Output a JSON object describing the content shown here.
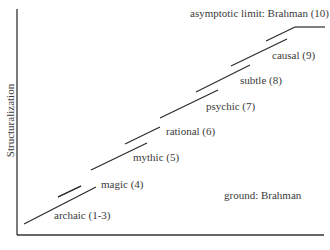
{
  "diagram": {
    "y_axis_label": "Structuralization",
    "ground_label": "ground: Brahman",
    "limit_label": "asymptotic limit: Brahman (10)",
    "levels": [
      {
        "label": "archaic (1-3)"
      },
      {
        "label": "magic (4)"
      },
      {
        "label": "mythic (5)"
      },
      {
        "label": "rational (6)"
      },
      {
        "label": "psychic (7)"
      },
      {
        "label": "subtle (8)"
      },
      {
        "label": "causal (9)"
      }
    ],
    "colors": {
      "line": "#2a2a2a",
      "text": "#3a3a3a",
      "background": "#ffffff"
    }
  }
}
